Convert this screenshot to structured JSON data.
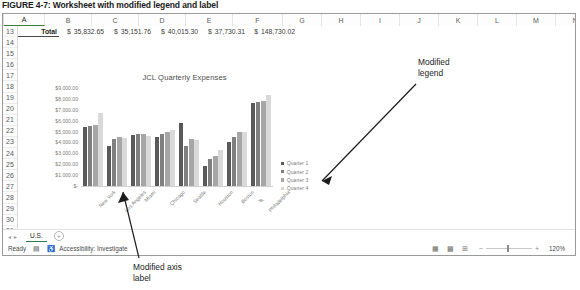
{
  "figure": {
    "caption": "FIGURE 4-7: Worksheet with modified legend and label"
  },
  "worksheet": {
    "columns": [
      "A",
      "B",
      "C",
      "D",
      "E",
      "F",
      "G",
      "H",
      "I",
      "J",
      "K",
      "L",
      "M",
      "N"
    ],
    "selected_column": "A",
    "rows": [
      "13",
      "14",
      "15",
      "16",
      "17",
      "18",
      "19",
      "20",
      "21",
      "22",
      "23",
      "24",
      "25",
      "26",
      "27",
      "28",
      "29",
      "30",
      "31"
    ],
    "row13": {
      "label": "Total",
      "values": [
        {
          "currency": "$",
          "amount": "35,832.65"
        },
        {
          "currency": "$",
          "amount": "35,151.76"
        },
        {
          "currency": "$",
          "amount": "40,015.30"
        },
        {
          "currency": "$",
          "amount": "37,730.31"
        },
        {
          "currency": "$",
          "amount": "148,730.02"
        }
      ]
    },
    "sheet_tab": "U.S.",
    "add_sheet_icon": "plus-circle-icon",
    "nav_prev_icon": "chevron-left-icon",
    "nav_next_icon": "chevron-right-icon"
  },
  "status_bar": {
    "ready_text": "Ready",
    "recording_icon": "record-macro-icon",
    "accessibility_icon": "accessibility-icon",
    "accessibility_text": "Accessibility: Investigate",
    "view_normal_icon": "normal-view-icon",
    "view_layout_icon": "page-layout-icon",
    "view_pagebreak_icon": "page-break-view-icon",
    "zoom_out_icon": "minus-icon",
    "zoom_in_icon": "plus-icon",
    "zoom_level": "120%"
  },
  "annotations": {
    "legend_note_line1": "Modified",
    "legend_note_line2": "legend",
    "axis_note_line1": "Modified axis",
    "axis_note_line2": "label"
  },
  "chart_data": {
    "type": "bar",
    "title": "JCL Quarterly Expenses",
    "xlabel": "",
    "ylabel": "",
    "grid": false,
    "legend_position": "right",
    "ylim": [
      0,
      9000
    ],
    "ytick_labels": [
      "$9,000.00",
      "$8,000.00",
      "$7,000.00",
      "$6,000.00",
      "$5,000.00",
      "$4,000.00",
      "$3,000.00",
      "$2,000.00",
      "$1,000.00",
      "$-"
    ],
    "ytick_values": [
      9000,
      8000,
      7000,
      6000,
      5000,
      4000,
      3000,
      2000,
      1000,
      0
    ],
    "categories": [
      "New York",
      "Los Angeles",
      "Miami",
      "Chicago",
      "Seattle",
      "Houston",
      "Boston",
      "Philadelphia"
    ],
    "series": [
      {
        "name": "Quarter 1",
        "color": "#595959",
        "values": [
          5450,
          3650,
          4700,
          4500,
          5750,
          1800,
          4050,
          7650
        ]
      },
      {
        "name": "Quarter 2",
        "color": "#808080",
        "values": [
          5500,
          4350,
          4800,
          4750,
          3700,
          2450,
          4500,
          7700
        ]
      },
      {
        "name": "Quarter 3",
        "color": "#a6a6a6",
        "values": [
          5600,
          4500,
          4750,
          5000,
          4300,
          2800,
          4950,
          7800
        ]
      },
      {
        "name": "Quarter 4",
        "color": "#d9d9d9",
        "values": [
          6700,
          4400,
          4600,
          5100,
          4250,
          3300,
          5000,
          8400
        ]
      }
    ]
  }
}
